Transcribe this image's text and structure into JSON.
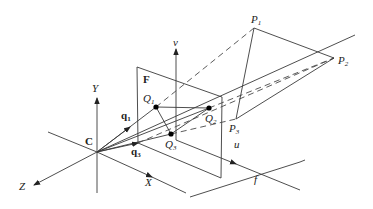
{
  "diagram": {
    "type": "pinhole-camera-projection",
    "labels": {
      "camera_center": "C",
      "frame": "F",
      "axis_x": "X",
      "axis_y": "Y",
      "axis_z": "Z",
      "image_u": "u",
      "image_v": "v",
      "focal_length": "f",
      "q1": "q",
      "q1_sub": "1",
      "q3": "q",
      "q3_sub": "3",
      "Q1": "Q",
      "Q1_sub": "1",
      "Q2": "Q",
      "Q2_sub": "2",
      "Q3": "Q",
      "Q3_sub": "3",
      "P1": "P",
      "P1_sub": "1",
      "P2": "P",
      "P2_sub": "2",
      "P3": "P",
      "P3_sub": "3"
    },
    "colors": {
      "line": "#3a3a3a",
      "background": "#ffffff",
      "point": "#000000"
    }
  }
}
